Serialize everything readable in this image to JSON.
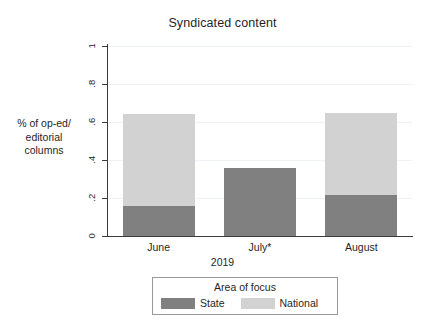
{
  "chart_data": {
    "type": "bar",
    "subtype": "stacked-bar",
    "title": "Syndicated content",
    "xlabel": "2019",
    "ylabel": "% of op-ed/ editorial columns",
    "ylabel_lines": [
      "% of op-ed/",
      "editorial",
      "columns"
    ],
    "categories": [
      "June",
      "July*",
      "August"
    ],
    "ylim": [
      0,
      1
    ],
    "ytick_labels": [
      "0",
      ".2",
      ".4",
      ".6",
      ".8",
      "1"
    ],
    "ytick_values": [
      0,
      0.2,
      0.4,
      0.6,
      0.8,
      1
    ],
    "grid": true,
    "legend_position": "bottom",
    "legend_title": "Area of focus",
    "series": [
      {
        "name": "State",
        "color": "#808080",
        "values": [
          0.16,
          0.36,
          0.215
        ]
      },
      {
        "name": "National",
        "color": "#d2d2d2",
        "values": [
          0.48,
          0.0,
          0.435
        ]
      }
    ],
    "totals": [
      0.64,
      0.36,
      0.65
    ]
  },
  "colors": {
    "state": "#808080",
    "national": "#d2d2d2",
    "axis": "#3c3c3c",
    "grid": "#eef1f5",
    "background": "#ffffff",
    "legend_border": "#9a9a9a",
    "text": "#1f1f1f"
  }
}
